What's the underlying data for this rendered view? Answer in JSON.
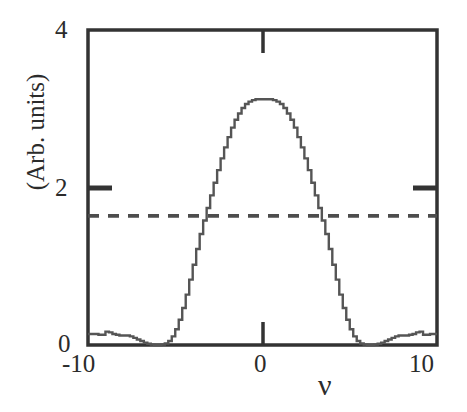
{
  "figure": {
    "name": "spectral-lineshape-plot",
    "background": "#ffffff",
    "frame_color": "#333333",
    "curve_color": "#555555",
    "dashed_color": "#4d4d4d"
  },
  "axes": {
    "y_label": "(Arb. units)",
    "x_label": "ν",
    "y_ticks": [
      {
        "value": 0,
        "label": "0"
      },
      {
        "value": 2,
        "label": "2"
      },
      {
        "value": 4,
        "label": "4"
      }
    ],
    "x_ticks": [
      {
        "value": -10,
        "label": "-10"
      },
      {
        "value": 0,
        "label": "0"
      },
      {
        "value": 10,
        "label": "10"
      }
    ]
  },
  "chart_data": {
    "type": "line",
    "title": "",
    "xlabel": "ν",
    "ylabel": "(Arb. units)",
    "xlim": [
      -10,
      10
    ],
    "ylim": [
      0,
      4
    ],
    "grid": false,
    "legend": "none",
    "series": [
      {
        "name": "lineshape",
        "style": "solid",
        "color": "#555555",
        "stepped": true,
        "x": [
          -10.0,
          -9.8,
          -9.6,
          -9.4,
          -9.2,
          -9.0,
          -8.8,
          -8.6,
          -8.4,
          -8.2,
          -8.0,
          -7.8,
          -7.6,
          -7.4,
          -7.2,
          -7.0,
          -6.8,
          -6.6,
          -6.4,
          -6.2,
          -6.0,
          -5.8,
          -5.6,
          -5.4,
          -5.2,
          -5.0,
          -4.8,
          -4.6,
          -4.4,
          -4.2,
          -4.0,
          -3.8,
          -3.6,
          -3.4,
          -3.2,
          -3.0,
          -2.8,
          -2.6,
          -2.4,
          -2.2,
          -2.0,
          -1.8,
          -1.6,
          -1.4,
          -1.2,
          -1.0,
          -0.8,
          -0.6,
          -0.4,
          -0.2,
          0.0,
          0.2,
          0.4,
          0.6,
          0.8,
          1.0,
          1.2,
          1.4,
          1.6,
          1.8,
          2.0,
          2.2,
          2.4,
          2.6,
          2.8,
          3.0,
          3.2,
          3.4,
          3.6,
          3.8,
          4.0,
          4.2,
          4.4,
          4.6,
          4.8,
          5.0,
          5.2,
          5.4,
          5.6,
          5.8,
          6.0,
          6.2,
          6.4,
          6.6,
          6.8,
          7.0,
          7.2,
          7.4,
          7.6,
          7.8,
          8.0,
          8.2,
          8.4,
          8.6,
          8.8,
          9.0,
          9.2,
          9.4,
          9.6,
          9.8,
          10.0
        ],
        "y": [
          0.14,
          0.14,
          0.14,
          0.13,
          0.13,
          0.17,
          0.16,
          0.14,
          0.13,
          0.12,
          0.12,
          0.12,
          0.11,
          0.09,
          0.07,
          0.05,
          0.03,
          0.015,
          0.005,
          0.0,
          0.0,
          0.005,
          0.02,
          0.05,
          0.11,
          0.2,
          0.32,
          0.47,
          0.64,
          0.83,
          1.02,
          1.22,
          1.41,
          1.58,
          1.74,
          1.9,
          2.06,
          2.22,
          2.37,
          2.51,
          2.64,
          2.76,
          2.86,
          2.94,
          3.01,
          3.06,
          3.09,
          3.11,
          3.12,
          3.12,
          3.12,
          3.12,
          3.12,
          3.11,
          3.09,
          3.06,
          3.01,
          2.94,
          2.86,
          2.76,
          2.64,
          2.51,
          2.37,
          2.22,
          2.06,
          1.9,
          1.74,
          1.58,
          1.41,
          1.22,
          1.02,
          0.83,
          0.64,
          0.47,
          0.32,
          0.2,
          0.11,
          0.05,
          0.02,
          0.005,
          0.0,
          0.0,
          0.005,
          0.015,
          0.03,
          0.05,
          0.07,
          0.09,
          0.11,
          0.12,
          0.12,
          0.12,
          0.13,
          0.14,
          0.16,
          0.17,
          0.13,
          0.13,
          0.14,
          0.14,
          0.14
        ]
      },
      {
        "name": "reference-level",
        "style": "dashed",
        "color": "#4d4d4d",
        "constant_y": 1.64
      }
    ]
  }
}
